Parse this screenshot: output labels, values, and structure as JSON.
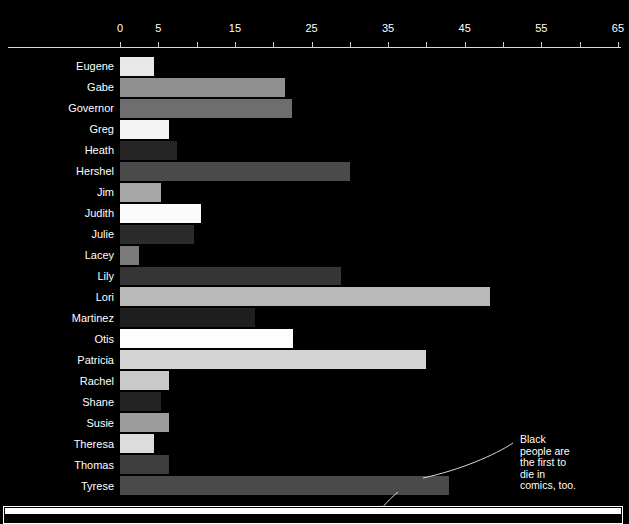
{
  "chart_data": {
    "type": "bar",
    "orientation": "horizontal",
    "title": "",
    "xlabel": "",
    "ylabel": "",
    "xlim": [
      0,
      65
    ],
    "grid": false,
    "legend": "none",
    "background_color": "#000000",
    "text_color": "#ffffff",
    "tick_values": [
      0,
      5,
      10,
      15,
      20,
      25,
      30,
      35,
      40,
      45,
      50,
      55,
      60,
      65
    ],
    "tick_labels_shown": [
      "0",
      "5",
      "15",
      "25",
      "35",
      "45",
      "55",
      "65"
    ],
    "categories": [
      "Eugene",
      "Gabe",
      "Governor",
      "Greg",
      "Heath",
      "Hershel",
      "Jim",
      "Judith",
      "Julie",
      "Lacey",
      "Lily",
      "Lori",
      "Martinez",
      "Otis",
      "Patricia",
      "Rachel",
      "Shane",
      "Susie",
      "Theresa",
      "Thomas",
      "Tyrese"
    ],
    "values": [
      4.5,
      21.6,
      22.5,
      6.4,
      7.4,
      30,
      5.3,
      10.6,
      9.6,
      2.5,
      28.9,
      48.3,
      17.6,
      22.6,
      40,
      6.4,
      5.3,
      6.4,
      4.5,
      6.4,
      43
    ],
    "bar_colors": [
      "#e8e8e8",
      "#8f8f8f",
      "#6e6e6e",
      "#f4f4f4",
      "#262626",
      "#4a4a4a",
      "#a6a6a6",
      "#fbfbfb",
      "#2b2b2b",
      "#7a7a7a",
      "#353535",
      "#b9b9b9",
      "#1f1f1f",
      "#fdfdfd",
      "#d4d4d4",
      "#c9c9c9",
      "#242424",
      "#9c9c9c",
      "#dcdcdc",
      "#3d3d3d",
      "#4a4a4a"
    ]
  },
  "axis": {
    "ticks": [
      {
        "value": 0,
        "label": "0"
      },
      {
        "value": 5,
        "label": "5"
      },
      {
        "value": 10,
        "label": ""
      },
      {
        "value": 15,
        "label": "15"
      },
      {
        "value": 20,
        "label": ""
      },
      {
        "value": 25,
        "label": "25"
      },
      {
        "value": 30,
        "label": ""
      },
      {
        "value": 35,
        "label": "35"
      },
      {
        "value": 40,
        "label": ""
      },
      {
        "value": 45,
        "label": "45"
      },
      {
        "value": 50,
        "label": ""
      },
      {
        "value": 55,
        "label": "55"
      },
      {
        "value": 60,
        "label": ""
      },
      {
        "value": 65,
        "label": "65"
      }
    ]
  },
  "annotation": {
    "lines": [
      "Black",
      "people are",
      "the first to",
      "die in",
      "comics, too."
    ],
    "text": "Black people are the first to die in comics, too."
  }
}
